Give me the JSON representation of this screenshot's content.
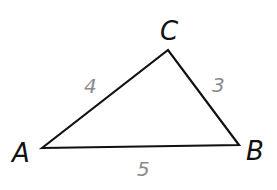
{
  "diagram": {
    "type": "triangle",
    "vertices": [
      {
        "name": "A",
        "x": 42,
        "y": 148
      },
      {
        "name": "B",
        "x": 239,
        "y": 145
      },
      {
        "name": "C",
        "x": 168,
        "y": 50
      }
    ],
    "sides": [
      {
        "between": "AC",
        "length": "4"
      },
      {
        "between": "CB",
        "length": "3"
      },
      {
        "between": "AB",
        "length": "5"
      }
    ],
    "colors": {
      "stroke": "#111111",
      "side_label": "#8a8a8a"
    }
  }
}
